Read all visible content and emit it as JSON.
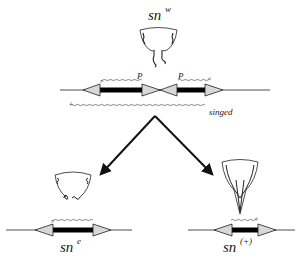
{
  "diagram": {
    "type": "genetic-allele-diagram",
    "top": {
      "allele_base": "sn",
      "allele_sup": "w",
      "bristle_icon": "wavy-bristle-icon",
      "elements": [
        {
          "label": "P",
          "direction": "left",
          "position": "left-element"
        },
        {
          "label": "P",
          "direction": "right",
          "position": "right-element"
        }
      ],
      "transcript_label": "singed",
      "transcript_direction": "left"
    },
    "branches": [
      {
        "id": "left",
        "allele_base": "sn",
        "allele_sup": "e",
        "bristle_icon": "curled-bristle-icon",
        "transcript_direction": "left"
      },
      {
        "id": "right",
        "allele_base": "sn",
        "allele_sup": "(+)",
        "bristle_icon": "straight-bristle-icon",
        "transcript_direction": "right"
      }
    ],
    "colors": {
      "line": "#222222",
      "triangle_fill": "#d8d8d8",
      "wavy": "#555555",
      "bar": "#000000"
    }
  }
}
